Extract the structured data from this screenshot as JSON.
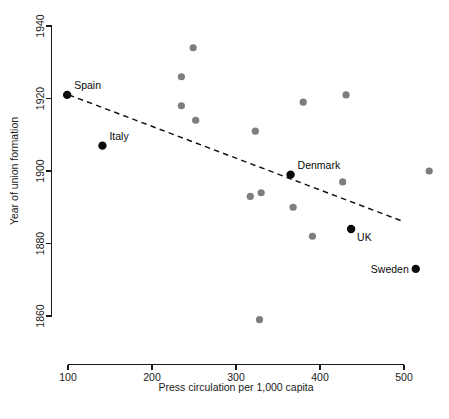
{
  "chart_data": {
    "type": "scatter",
    "title": "",
    "xlabel": "Press circulation per 1,000 capita",
    "ylabel": "Year of union formation",
    "xlim": [
      70,
      545
    ],
    "ylim": [
      1852,
      1942
    ],
    "xticks": [
      100,
      200,
      300,
      400,
      500
    ],
    "xtick_labels": [
      "100",
      "200",
      "300",
      "400",
      "500"
    ],
    "yticks": [
      1860,
      1880,
      1900,
      1920,
      1940
    ],
    "ytick_labels": [
      "1860",
      "1880",
      "1900",
      "1920",
      "1940"
    ],
    "grid": false,
    "legend": null,
    "points": [
      {
        "label": "Spain",
        "x": 99,
        "y": 1921,
        "highlighted": true
      },
      {
        "label": "Italy",
        "x": 141,
        "y": 1907,
        "highlighted": true
      },
      {
        "label": "Denmark",
        "x": 365,
        "y": 1899,
        "highlighted": true
      },
      {
        "label": "UK",
        "x": 437,
        "y": 1884,
        "highlighted": true
      },
      {
        "label": "Sweden",
        "x": 514,
        "y": 1873,
        "highlighted": true
      },
      {
        "label": "",
        "x": 249,
        "y": 1934,
        "highlighted": false
      },
      {
        "label": "",
        "x": 235,
        "y": 1926,
        "highlighted": false
      },
      {
        "label": "",
        "x": 235,
        "y": 1918,
        "highlighted": false
      },
      {
        "label": "",
        "x": 252,
        "y": 1914,
        "highlighted": false
      },
      {
        "label": "",
        "x": 323,
        "y": 1911,
        "highlighted": false
      },
      {
        "label": "",
        "x": 380,
        "y": 1919,
        "highlighted": false
      },
      {
        "label": "",
        "x": 431,
        "y": 1921,
        "highlighted": false
      },
      {
        "label": "",
        "x": 530,
        "y": 1900,
        "highlighted": false
      },
      {
        "label": "",
        "x": 427,
        "y": 1897,
        "highlighted": false
      },
      {
        "label": "",
        "x": 317,
        "y": 1893,
        "highlighted": false
      },
      {
        "label": "",
        "x": 330,
        "y": 1894,
        "highlighted": false
      },
      {
        "label": "",
        "x": 368,
        "y": 1890,
        "highlighted": false
      },
      {
        "label": "",
        "x": 391,
        "y": 1882,
        "highlighted": false
      },
      {
        "label": "",
        "x": 328,
        "y": 1859,
        "highlighted": false
      }
    ],
    "trend_line": {
      "style": "dashed",
      "x_start": 101,
      "y_start": 1921,
      "x_end": 500,
      "y_end": 1886
    },
    "annotations": [
      {
        "text": "Spain",
        "anchor_x": 99,
        "anchor_y": 1921,
        "position": "above-right"
      },
      {
        "text": "Italy",
        "anchor_x": 141,
        "anchor_y": 1907,
        "position": "above-right"
      },
      {
        "text": "Denmark",
        "anchor_x": 365,
        "anchor_y": 1899,
        "position": "above-right"
      },
      {
        "text": "UK",
        "anchor_x": 437,
        "anchor_y": 1884,
        "position": "below-right"
      },
      {
        "text": "Sweden",
        "anchor_x": 514,
        "anchor_y": 1873,
        "position": "left"
      }
    ]
  }
}
